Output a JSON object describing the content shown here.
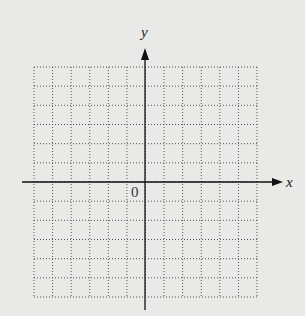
{
  "diagram": {
    "type": "coordinate-grid",
    "x_axis_label": "x",
    "y_axis_label": "y",
    "origin_label": "0",
    "grid": {
      "columns": 12,
      "rows": 12,
      "style": "dotted"
    },
    "colors": {
      "background": "#e9e9e7",
      "grid": "#555555",
      "axis": "#111111"
    }
  }
}
